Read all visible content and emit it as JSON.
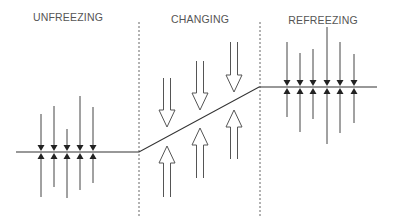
{
  "phases": [
    {
      "label": "UNFREEZING",
      "x": 68,
      "y": 11
    },
    {
      "label": "CHANGING",
      "x": 200,
      "y": 13
    },
    {
      "label": "REFREEZING",
      "x": 323,
      "y": 14
    }
  ],
  "colors": {
    "line": "#333333",
    "arrow": "#444444",
    "hollow": "#555555",
    "divider": "#666666",
    "text": "#555555"
  },
  "dividers": [
    {
      "x": 139,
      "y1": 22,
      "y2": 218
    },
    {
      "x": 260,
      "y1": 22,
      "y2": 218
    }
  ],
  "baseline": {
    "points": [
      [
        16,
        152
      ],
      [
        139,
        152
      ],
      [
        259,
        87
      ],
      [
        377,
        87
      ]
    ]
  },
  "unfreezing_forces": {
    "y": 152,
    "arrows": [
      {
        "x": 41,
        "top": 114,
        "bottom": 197
      },
      {
        "x": 54,
        "top": 106,
        "bottom": 187
      },
      {
        "x": 67,
        "top": 129,
        "bottom": 198
      },
      {
        "x": 80,
        "top": 96,
        "bottom": 190
      },
      {
        "x": 93,
        "top": 107,
        "bottom": 183
      }
    ]
  },
  "refreezing_forces": {
    "y": 87,
    "arrows": [
      {
        "x": 287,
        "top": 42,
        "bottom": 117
      },
      {
        "x": 300,
        "top": 53,
        "bottom": 132
      },
      {
        "x": 313,
        "top": 49,
        "bottom": 119
      },
      {
        "x": 327,
        "top": 27,
        "bottom": 144
      },
      {
        "x": 340,
        "top": 42,
        "bottom": 133
      },
      {
        "x": 354,
        "top": 54,
        "bottom": 123
      }
    ]
  },
  "changing_forces": {
    "down": [
      {
        "x": 167,
        "top": 78,
        "tip": 127
      },
      {
        "x": 200,
        "top": 61,
        "tip": 110
      },
      {
        "x": 234,
        "top": 42,
        "tip": 92
      }
    ],
    "up": [
      {
        "x": 167,
        "tip": 146,
        "bottom": 197
      },
      {
        "x": 200,
        "tip": 128,
        "bottom": 178
      },
      {
        "x": 234,
        "tip": 110,
        "bottom": 159
      }
    ]
  }
}
